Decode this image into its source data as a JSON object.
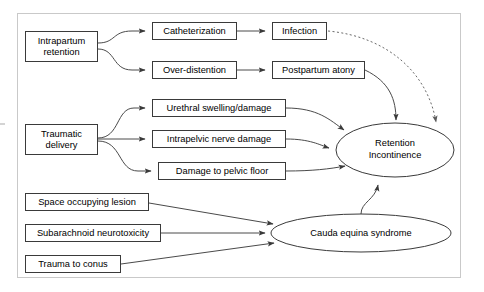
{
  "diagram": {
    "frame": {
      "x": 17,
      "y": 13,
      "width": 444,
      "height": 265
    },
    "colors": {
      "node_stroke": "#3a3a3a",
      "edge_stroke": "#4a4a4a",
      "dotted_edge_stroke": "#6a6a6a",
      "frame_stroke": "#c9c9c9",
      "node_fill": "#ffffff",
      "text": "#000000",
      "background": "#ffffff"
    },
    "nodes": [
      {
        "id": "intrapartum-retention",
        "shape": "box",
        "label": "Intrapartum\nretention",
        "lines": [
          "Intrapartum",
          "retention"
        ],
        "x": 25,
        "y": 31,
        "width": 73,
        "height": 31
      },
      {
        "id": "catheterization",
        "shape": "box",
        "label": "Catheterization",
        "lines": [
          "Catheterization"
        ],
        "x": 152,
        "y": 22,
        "width": 85,
        "height": 18
      },
      {
        "id": "infection",
        "shape": "box",
        "label": "Infection",
        "lines": [
          "Infection"
        ],
        "x": 272,
        "y": 22,
        "width": 55,
        "height": 18
      },
      {
        "id": "over-distention",
        "shape": "box",
        "label": "Over-distention",
        "lines": [
          "Over-distention"
        ],
        "x": 152,
        "y": 61,
        "width": 85,
        "height": 18
      },
      {
        "id": "postpartum-atony",
        "shape": "box",
        "label": "Postpartum atony",
        "lines": [
          "Postpartum atony"
        ],
        "x": 272,
        "y": 61,
        "width": 93,
        "height": 18
      },
      {
        "id": "traumatic-delivery",
        "shape": "box",
        "label": "Traumatic\ndelivery",
        "lines": [
          "Traumatic",
          "delivery"
        ],
        "x": 25,
        "y": 124,
        "width": 73,
        "height": 31
      },
      {
        "id": "urethral-swelling-damage",
        "shape": "box",
        "label": "Urethral swelling/damage",
        "lines": [
          "Urethral swelling/damage"
        ],
        "x": 152,
        "y": 99,
        "width": 134,
        "height": 18
      },
      {
        "id": "intrapelvic-nerve-damage",
        "shape": "box",
        "label": "Intrapelvic nerve damage",
        "lines": [
          "Intrapelvic nerve damage"
        ],
        "x": 152,
        "y": 130,
        "width": 134,
        "height": 18
      },
      {
        "id": "damage-to-pelvic-floor",
        "shape": "box",
        "label": "Damage to pelvic floor",
        "lines": [
          "Damage to pelvic floor"
        ],
        "x": 158,
        "y": 162,
        "width": 128,
        "height": 18
      },
      {
        "id": "retention-incontinence",
        "shape": "ellipse",
        "label": "Retention\nIncontinence",
        "lines": [
          "Retention",
          "Incontinence"
        ],
        "cx": 395,
        "cy": 150,
        "rx": 59,
        "ry": 27
      },
      {
        "id": "space-occupying-lesion",
        "shape": "box",
        "label": "Space occupying lesion",
        "lines": [
          "Space occupying lesion"
        ],
        "x": 25,
        "y": 193,
        "width": 124,
        "height": 18
      },
      {
        "id": "subarachnoid-neurotoxicity",
        "shape": "box",
        "label": "Subarachnoid neurotoxicity",
        "lines": [
          "Subarachnoid neurotoxicity"
        ],
        "x": 25,
        "y": 224,
        "width": 136,
        "height": 18
      },
      {
        "id": "trauma-to-conus",
        "shape": "box",
        "label": "Trauma to conus",
        "lines": [
          "Trauma to conus"
        ],
        "x": 25,
        "y": 255,
        "width": 96,
        "height": 18
      },
      {
        "id": "cauda-equina-syndrome",
        "shape": "ellipse",
        "label": "Cauda equina syndrome",
        "lines": [
          "Cauda equina syndrome"
        ],
        "cx": 361,
        "cy": 233,
        "rx": 90,
        "ry": 19
      }
    ],
    "edges": [
      {
        "id": "e1",
        "from": "intrapartum-retention",
        "to": "catheterization",
        "style": "solid",
        "arrow": true
      },
      {
        "id": "e2",
        "from": "intrapartum-retention",
        "to": "over-distention",
        "style": "solid",
        "arrow": true
      },
      {
        "id": "e3",
        "from": "catheterization",
        "to": "infection",
        "style": "solid",
        "arrow": true
      },
      {
        "id": "e4",
        "from": "over-distention",
        "to": "postpartum-atony",
        "style": "solid",
        "arrow": true
      },
      {
        "id": "e5",
        "from": "infection",
        "to": "retention-incontinence",
        "style": "dotted",
        "arrow": true
      },
      {
        "id": "e6",
        "from": "postpartum-atony",
        "to": "retention-incontinence",
        "style": "solid",
        "arrow": true
      },
      {
        "id": "e7",
        "from": "traumatic-delivery",
        "to": "urethral-swelling-damage",
        "style": "solid",
        "arrow": true
      },
      {
        "id": "e8",
        "from": "traumatic-delivery",
        "to": "intrapelvic-nerve-damage",
        "style": "solid",
        "arrow": true
      },
      {
        "id": "e9",
        "from": "traumatic-delivery",
        "to": "damage-to-pelvic-floor",
        "style": "solid",
        "arrow": true
      },
      {
        "id": "e10",
        "from": "urethral-swelling-damage",
        "to": "retention-incontinence",
        "style": "solid",
        "arrow": true
      },
      {
        "id": "e11",
        "from": "intrapelvic-nerve-damage",
        "to": "retention-incontinence",
        "style": "solid",
        "arrow": true
      },
      {
        "id": "e12",
        "from": "damage-to-pelvic-floor",
        "to": "retention-incontinence",
        "style": "solid",
        "arrow": true
      },
      {
        "id": "e13",
        "from": "space-occupying-lesion",
        "to": "cauda-equina-syndrome",
        "style": "solid",
        "arrow": true
      },
      {
        "id": "e14",
        "from": "subarachnoid-neurotoxicity",
        "to": "cauda-equina-syndrome",
        "style": "solid",
        "arrow": true
      },
      {
        "id": "e15",
        "from": "trauma-to-conus",
        "to": "cauda-equina-syndrome",
        "style": "solid",
        "arrow": true
      },
      {
        "id": "e16",
        "from": "cauda-equina-syndrome",
        "to": "retention-incontinence",
        "style": "solid",
        "arrow": true
      }
    ]
  }
}
